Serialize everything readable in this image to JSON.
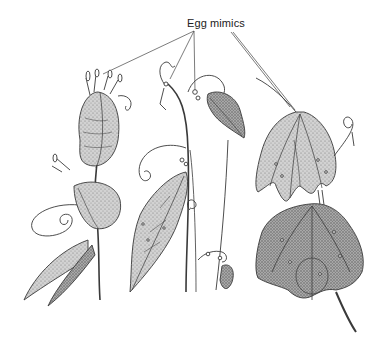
{
  "figure": {
    "label": "Egg mimics",
    "colors": {
      "ink": "#3a3a3a",
      "leaf_fill_light": "#c9c9c9",
      "leaf_fill_mid": "#a8a8a8",
      "leaf_fill_dark": "#8c8c8c",
      "background": "#ffffff"
    },
    "plants": [
      {
        "name": "left-vine",
        "description": "vine with folded leaves and spiral tendrils, egg mimics at shoot tip"
      },
      {
        "name": "center-vine",
        "description": "vertical stem with lanceolate leaf and small egg-mimic beads on tendrils"
      },
      {
        "name": "right-vine",
        "description": "stem with two broad three-lobed leaves bearing egg-mimic spots"
      }
    ]
  }
}
